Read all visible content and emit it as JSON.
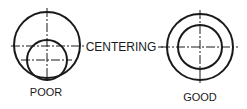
{
  "diagram": {
    "labels": {
      "center": "CENTERING",
      "left": "POOR",
      "right": "GOOD"
    },
    "colors": {
      "stroke": "#1a1a1a",
      "background": "#ffffff"
    }
  }
}
